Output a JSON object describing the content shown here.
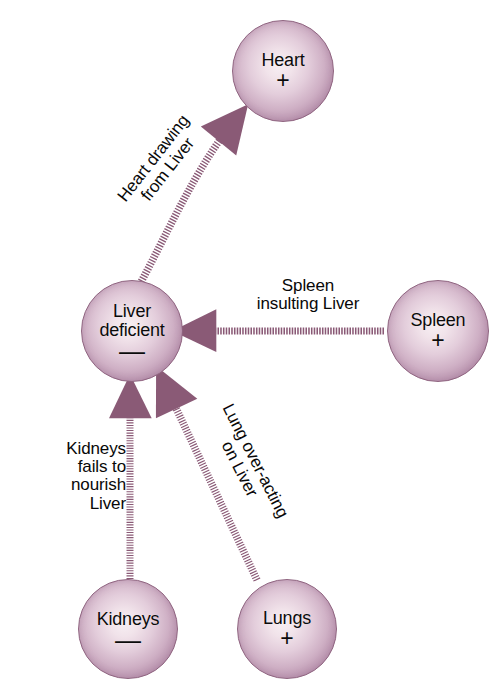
{
  "diagram": {
    "type": "node-link-diagram",
    "background_color": "#ffffff",
    "accent_color": "#8a5a76",
    "node_fill_center": "#f7eff3",
    "node_fill_edge": "#a07696",
    "node_border_color": "#8f6480",
    "text_color": "#0b0b0b",
    "nodes": [
      {
        "id": "heart",
        "label": "Heart",
        "sign": "+",
        "sign_name": "plus",
        "cx": 283,
        "cy": 71,
        "r": 51
      },
      {
        "id": "liver",
        "label": "Liver\ndeficient",
        "sign": "—",
        "sign_name": "minus",
        "cx": 132,
        "cy": 331,
        "r": 51
      },
      {
        "id": "spleen",
        "label": "Spleen",
        "sign": "+",
        "sign_name": "plus",
        "cx": 438,
        "cy": 331,
        "r": 51
      },
      {
        "id": "kidneys",
        "label": "Kidneys",
        "sign": "—",
        "sign_name": "minus",
        "cx": 128,
        "cy": 629,
        "r": 50
      },
      {
        "id": "lungs",
        "label": "Lungs",
        "sign": "+",
        "sign_name": "plus",
        "cx": 287,
        "cy": 629,
        "r": 50
      }
    ],
    "edges": [
      {
        "id": "heart-drawing",
        "label": "Heart drawing\nfrom Liver",
        "from": "liver",
        "to": "heart",
        "style": "dotted",
        "shape": "curved",
        "arrowhead": "to"
      },
      {
        "id": "spleen-insulting",
        "label": "Spleen\ninsulting Liver",
        "from": "spleen",
        "to": "liver",
        "style": "dashed",
        "shape": "straight-horizontal",
        "arrowhead": "to"
      },
      {
        "id": "kidneys-fails",
        "label": "Kidneys\nfails to\nnourish\nLiver",
        "from": "kidneys",
        "to": "liver",
        "style": "dotted",
        "shape": "straight-vertical",
        "arrowhead": "to"
      },
      {
        "id": "lung-overacting",
        "label": "Lung over-acting\non Liver",
        "from": "lungs",
        "to": "liver",
        "style": "dotted",
        "shape": "straight-diagonal",
        "arrowhead": "to"
      }
    ]
  }
}
